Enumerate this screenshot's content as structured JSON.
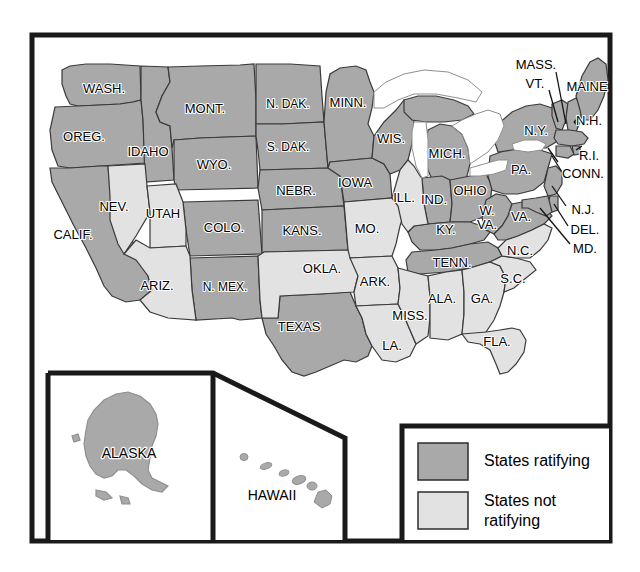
{
  "figure": {
    "frame_color": "#1a1a1a",
    "background": "#ffffff"
  },
  "colors": {
    "ratifying": "#a9a9a9",
    "not_ratifying": "#e2e2e2",
    "water": "#ffffff",
    "border": "#3a3a3a",
    "outline": "#555555",
    "frame": "#1a1a1a",
    "text": "#000000"
  },
  "legend": {
    "items": [
      {
        "label": "States ratifying",
        "swatch": "ratifying"
      },
      {
        "label": "States not ratifying",
        "swatch": "not_ratifying"
      }
    ]
  },
  "inset": {
    "alaska_label": "ALASKA",
    "hawaii_label": "HAWAII"
  },
  "states": [
    {
      "code": "WA",
      "label": "WASH.",
      "status": "ratifying",
      "lx": 104,
      "ly": 90
    },
    {
      "code": "OR",
      "label": "OREG.",
      "status": "ratifying",
      "lx": 84,
      "ly": 138
    },
    {
      "code": "CA",
      "label": "CALIF.",
      "status": "ratifying",
      "lx": 73,
      "ly": 236
    },
    {
      "code": "NV",
      "label": "NEV.",
      "status": "not_ratifying",
      "lx": 114,
      "ly": 208
    },
    {
      "code": "ID",
      "label": "IDAHO",
      "status": "ratifying",
      "lx": 148,
      "ly": 153
    },
    {
      "code": "UT",
      "label": "UTAH",
      "status": "not_ratifying",
      "lx": 163,
      "ly": 215
    },
    {
      "code": "AZ",
      "label": "ARIZ.",
      "status": "not_ratifying",
      "lx": 157,
      "ly": 287
    },
    {
      "code": "MT",
      "label": "MONT.",
      "status": "ratifying",
      "lx": 205,
      "ly": 110
    },
    {
      "code": "WY",
      "label": "WYO.",
      "status": "ratifying",
      "lx": 214,
      "ly": 166
    },
    {
      "code": "CO",
      "label": "COLO.",
      "status": "ratifying",
      "lx": 224,
      "ly": 229
    },
    {
      "code": "NM",
      "label": "N. MEX.",
      "status": "ratifying",
      "lx": 225,
      "ly": 288
    },
    {
      "code": "ND",
      "label": "N. DAK.",
      "status": "ratifying",
      "lx": 288,
      "ly": 105
    },
    {
      "code": "SD",
      "label": "S. DAK.",
      "status": "ratifying",
      "lx": 288,
      "ly": 148
    },
    {
      "code": "NE",
      "label": "NEBR.",
      "status": "ratifying",
      "lx": 296,
      "ly": 192
    },
    {
      "code": "KS",
      "label": "KANS.",
      "status": "ratifying",
      "lx": 302,
      "ly": 232
    },
    {
      "code": "OK",
      "label": "OKLA.",
      "status": "not_ratifying",
      "lx": 322,
      "ly": 270
    },
    {
      "code": "TX",
      "label": "TEXAS",
      "status": "ratifying",
      "lx": 299,
      "ly": 328
    },
    {
      "code": "MN",
      "label": "MINN.",
      "status": "ratifying",
      "lx": 348,
      "ly": 104
    },
    {
      "code": "IA",
      "label": "IOWA",
      "status": "ratifying",
      "lx": 355,
      "ly": 184
    },
    {
      "code": "MO",
      "label": "MO.",
      "status": "not_ratifying",
      "lx": 367,
      "ly": 230
    },
    {
      "code": "AR",
      "label": "ARK.",
      "status": "not_ratifying",
      "lx": 375,
      "ly": 283
    },
    {
      "code": "LA",
      "label": "LA.",
      "status": "not_ratifying",
      "lx": 392,
      "ly": 347
    },
    {
      "code": "WI",
      "label": "WIS.",
      "status": "ratifying",
      "lx": 391,
      "ly": 140
    },
    {
      "code": "IL",
      "label": "ILL.",
      "status": "not_ratifying",
      "lx": 404,
      "ly": 199
    },
    {
      "code": "MS",
      "label": "MISS.",
      "status": "not_ratifying",
      "lx": 410,
      "ly": 317
    },
    {
      "code": "IN",
      "label": "IND.",
      "status": "ratifying",
      "lx": 434,
      "ly": 201
    },
    {
      "code": "MI",
      "label": "MICH.",
      "status": "ratifying",
      "lx": 447,
      "ly": 155
    },
    {
      "code": "KY",
      "label": "KY.",
      "status": "ratifying",
      "lx": 446,
      "ly": 231
    },
    {
      "code": "TN",
      "label": "TENN.",
      "status": "ratifying",
      "lx": 452,
      "ly": 264
    },
    {
      "code": "AL",
      "label": "ALA.",
      "status": "not_ratifying",
      "lx": 442,
      "ly": 300
    },
    {
      "code": "OH",
      "label": "OHIO",
      "status": "ratifying",
      "lx": 470,
      "ly": 192
    },
    {
      "code": "WV",
      "label": "W.",
      "status": "ratifying",
      "lx": 487,
      "ly": 212
    },
    {
      "code": "WV2",
      "label": "VA.",
      "status": "ratifying",
      "lx": 487,
      "ly": 226
    },
    {
      "code": "VA",
      "label": "VA.",
      "status": "ratifying",
      "lx": 521,
      "ly": 218
    },
    {
      "code": "GA",
      "label": "GA.",
      "status": "not_ratifying",
      "lx": 482,
      "ly": 300
    },
    {
      "code": "FL",
      "label": "FLA.",
      "status": "not_ratifying",
      "lx": 497,
      "ly": 343
    },
    {
      "code": "SC",
      "label": "S.C.",
      "status": "not_ratifying",
      "lx": 513,
      "ly": 280
    },
    {
      "code": "NC",
      "label": "N.C.",
      "status": "not_ratifying",
      "lx": 520,
      "ly": 252
    },
    {
      "code": "PA",
      "label": "PA.",
      "status": "ratifying",
      "lx": 521,
      "ly": 171
    },
    {
      "code": "NY",
      "label": "N.Y.",
      "status": "ratifying",
      "lx": 536,
      "ly": 132
    }
  ],
  "callout_labels": [
    {
      "code": "MA",
      "label": "MASS.",
      "status": "ratifying",
      "lx": 536,
      "ly": 66
    },
    {
      "code": "VT",
      "label": "VT.",
      "status": "ratifying",
      "lx": 535,
      "ly": 85
    },
    {
      "code": "ME",
      "label": "MAINE",
      "status": "ratifying",
      "lx": 587,
      "ly": 88
    },
    {
      "code": "NH",
      "label": "N.H.",
      "status": "ratifying",
      "lx": 589,
      "ly": 122
    },
    {
      "code": "RI",
      "label": "R.I.",
      "status": "ratifying",
      "lx": 589,
      "ly": 157
    },
    {
      "code": "CT",
      "label": "CONN.",
      "status": "ratifying",
      "lx": 583,
      "ly": 175
    },
    {
      "code": "NJ",
      "label": "N.J.",
      "status": "ratifying",
      "lx": 583,
      "ly": 211
    },
    {
      "code": "DE",
      "label": "DEL.",
      "status": "ratifying",
      "lx": 585,
      "ly": 231
    },
    {
      "code": "MD",
      "label": "MD.",
      "status": "ratifying",
      "lx": 585,
      "ly": 250
    }
  ]
}
